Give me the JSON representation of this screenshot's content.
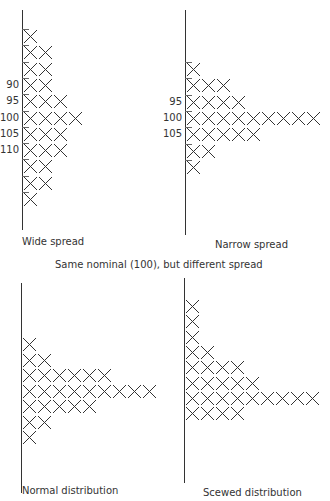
{
  "figure": {
    "caption_center": "Same nominal (100), but different spread",
    "mark_symbol": "X",
    "ink_color": "#333333"
  },
  "chart_data": [
    {
      "type": "bar",
      "orientation": "horizontal-tally",
      "title": "Wide spread",
      "row_counts": [
        1,
        2,
        2,
        2,
        3,
        4,
        3,
        3,
        2,
        2,
        1
      ],
      "row_labels": [
        "",
        "",
        "",
        "90",
        "95",
        "100",
        "105",
        "110",
        "",
        "",
        ""
      ],
      "tick_labels": [
        "90",
        "95",
        "100",
        "105",
        "110"
      ],
      "xlabel": "",
      "ylabel": "",
      "grid": false
    },
    {
      "type": "bar",
      "orientation": "horizontal-tally",
      "title": "Narrow spread",
      "row_counts": [
        1,
        3,
        4,
        9,
        5,
        2,
        1
      ],
      "row_labels": [
        "",
        "",
        "95",
        "100",
        "105",
        "",
        ""
      ],
      "tick_labels": [
        "95",
        "100",
        "105"
      ],
      "xlabel": "",
      "ylabel": "",
      "grid": false
    },
    {
      "type": "bar",
      "orientation": "horizontal-tally",
      "title": "Normal distribution",
      "row_counts": [
        1,
        2,
        6,
        9,
        5,
        2,
        1
      ],
      "row_labels": [
        "",
        "",
        "",
        "",
        "",
        "",
        ""
      ],
      "xlabel": "",
      "ylabel": "",
      "grid": false
    },
    {
      "type": "bar",
      "orientation": "horizontal-tally",
      "title": "Scewed distribution",
      "row_counts": [
        1,
        1,
        1,
        2,
        4,
        5,
        9,
        4
      ],
      "row_labels": [
        "",
        "",
        "",
        "",
        "",
        "",
        "",
        ""
      ],
      "xlabel": "",
      "ylabel": "",
      "grid": false
    }
  ],
  "layout": [
    {
      "axis_x": 22,
      "axis_top": 10,
      "axis_bottom": 230,
      "row_top": 29,
      "row_step": 16.3,
      "caption_x": 22,
      "caption_y": 236
    },
    {
      "axis_x": 185,
      "axis_top": 10,
      "axis_bottom": 235,
      "row_top": 62,
      "row_step": 16.3,
      "caption_x": 215,
      "caption_y": 239
    },
    {
      "axis_x": 21,
      "axis_top": 283,
      "axis_bottom": 493,
      "row_top": 337,
      "row_step": 15.5,
      "caption_x": 22,
      "caption_y": 485
    },
    {
      "axis_x": 184,
      "axis_top": 278,
      "axis_bottom": 483,
      "row_top": 299,
      "row_step": 15.3,
      "caption_x": 203,
      "caption_y": 487
    }
  ]
}
